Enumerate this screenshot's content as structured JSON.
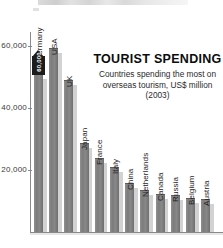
{
  "chart_data": {
    "type": "bar",
    "title": "TOURIST SPENDING",
    "subtitle_line1": "Countries spending the most on",
    "subtitle_line2": "overseas tourism, US$ million (2003)",
    "xlabel": "",
    "ylabel": "",
    "ylim": [
      0,
      65000
    ],
    "grid": false,
    "legend": "none",
    "yticks": [
      {
        "label": "60,000",
        "value": 60000
      },
      {
        "label": "40,000",
        "value": 40000
      },
      {
        "label": "20,000",
        "value": 20000
      }
    ],
    "categories": [
      "Germany",
      "USA",
      "UK",
      "Japan",
      "France",
      "Italy",
      "China",
      "Netherlands",
      "Canada",
      "Russia",
      "Belgium",
      "Austria"
    ],
    "values": [
      50700,
      58900,
      48800,
      28500,
      23500,
      20500,
      15600,
      13100,
      11800,
      11500,
      10800,
      10200
    ],
    "annotation": {
      "target": "Germany",
      "label": "60,000",
      "shape": "arrow-callout"
    }
  },
  "colors": {
    "bar_fill": "#7c7c7c",
    "bar_shadow": "#d2d2d2",
    "axis": "#8a8a8a",
    "title": "#0c0c0c",
    "subtitle": "#2b2b2b",
    "callout": "#1c1c1c",
    "background": "#ffffff"
  }
}
